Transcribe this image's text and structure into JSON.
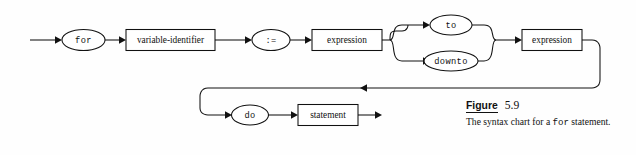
{
  "figure": {
    "label_word": "Figure",
    "number": "5.9",
    "caption_before": "The syntax chart for a ",
    "caption_keyword": "for",
    "caption_after": " statement."
  },
  "diagram": {
    "type": "railroad-syntax-chart",
    "title": "for statement",
    "background": "#fefefe",
    "line_color": "#111111",
    "nodes": {
      "for_keyword": "for",
      "variable_identifier": "variable-identifier",
      "assign_operator": ":=",
      "expression_initial": "expression",
      "to_keyword": "to",
      "downto_keyword": "downto",
      "expression_final": "expression",
      "do_keyword": "do",
      "statement": "statement"
    },
    "row1_sequence": [
      "for",
      "variable-identifier",
      ":=",
      "expression",
      "to | downto",
      "expression"
    ],
    "row2_sequence": [
      "do",
      "statement"
    ],
    "branch_alternatives": [
      "to",
      "downto"
    ]
  }
}
